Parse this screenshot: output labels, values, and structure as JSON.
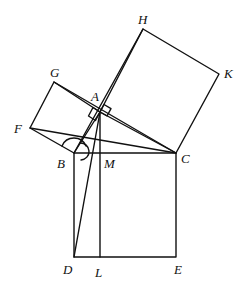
{
  "diagram": {
    "stroke_color": "#111111",
    "background": "#ffffff",
    "points": {
      "A": {
        "x": 100,
        "y": 112
      },
      "B": {
        "x": 74,
        "y": 153
      },
      "C": {
        "x": 176,
        "y": 153
      },
      "D": {
        "x": 74,
        "y": 257
      },
      "E": {
        "x": 176,
        "y": 257
      },
      "F": {
        "x": 30,
        "y": 128
      },
      "G": {
        "x": 54,
        "y": 82
      },
      "H": {
        "x": 143,
        "y": 29
      },
      "K": {
        "x": 219,
        "y": 74
      },
      "L": {
        "x": 100,
        "y": 257
      },
      "M": {
        "x": 100,
        "y": 153
      }
    },
    "labels": {
      "A": "A",
      "B": "B",
      "C": "C",
      "D": "D",
      "E": "E",
      "F": "F",
      "G": "G",
      "H": "H",
      "K": "K",
      "L": "L",
      "M": "M"
    },
    "shapes": [
      {
        "name": "square-BCED",
        "vertices": [
          "B",
          "C",
          "E",
          "D"
        ]
      },
      {
        "name": "square-ABFG",
        "vertices": [
          "A",
          "G",
          "F",
          "B"
        ]
      },
      {
        "name": "square-ACKH",
        "vertices": [
          "A",
          "H",
          "K",
          "C"
        ]
      }
    ],
    "segments": [
      [
        "A",
        "B"
      ],
      [
        "A",
        "C"
      ],
      [
        "F",
        "C"
      ],
      [
        "A",
        "D"
      ],
      [
        "A",
        "L"
      ],
      [
        "G",
        "C"
      ],
      [
        "B",
        "H"
      ]
    ],
    "annotations": [
      {
        "type": "right-angle-marker",
        "at": "A"
      },
      {
        "type": "angle-arc",
        "at": "B"
      }
    ]
  }
}
